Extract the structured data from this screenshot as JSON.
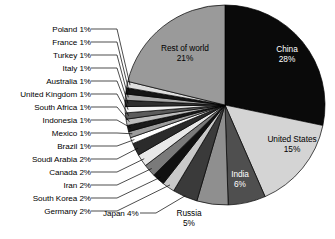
{
  "chart_data": {
    "type": "pie",
    "title": "",
    "subtitle": "",
    "xlabel": "",
    "ylabel": "",
    "legend_position": "none",
    "grid": false,
    "units": "percent",
    "total": 100,
    "categories": [
      "China",
      "United States",
      "India",
      "Russia",
      "Japan",
      "Germany",
      "South Korea",
      "Iran",
      "Canada",
      "Soudi Arabia",
      "Brazil",
      "Mexico",
      "Indonesia",
      "South Africa",
      "United Kingdom",
      "Australia",
      "Italy",
      "Turkey",
      "France",
      "Poland",
      "Rest of world"
    ],
    "values": [
      28,
      15,
      6,
      5,
      4,
      2,
      2,
      2,
      2,
      2,
      1,
      1,
      1,
      1,
      1,
      1,
      1,
      1,
      1,
      1,
      21
    ],
    "slices": [
      {
        "name": "China",
        "value": 28,
        "pct_text": "28%",
        "label": "China 28%",
        "color": "#0a0a0a",
        "label_placement": "inside",
        "label_color": "#ffffff"
      },
      {
        "name": "United States",
        "value": 15,
        "pct_text": "15%",
        "label": "United States 15%",
        "color": "#d4d4d4",
        "label_placement": "inside",
        "label_color": "#000000"
      },
      {
        "name": "India",
        "value": 6,
        "pct_text": "6%",
        "label": "India 6%",
        "color": "#4f4f4f",
        "label_placement": "inside",
        "label_color": "#ffffff"
      },
      {
        "name": "Russia",
        "value": 5,
        "pct_text": "5%",
        "label": "Russia 5%",
        "color": "#8f8f8f",
        "label_placement": "outside",
        "label_color": "#000000"
      },
      {
        "name": "Japan",
        "value": 4,
        "pct_text": "4%",
        "label": "Japan 4%",
        "color": "#3a3a3a",
        "label_placement": "callout",
        "label_color": "#000000"
      },
      {
        "name": "Germany",
        "value": 2,
        "pct_text": "2%",
        "label": "Germany 2%",
        "color": "#c9c9c9",
        "label_placement": "callout",
        "label_color": "#000000"
      },
      {
        "name": "South Korea",
        "value": 2,
        "pct_text": "2%",
        "label": "South Korea 2%",
        "color": "#111111",
        "label_placement": "callout",
        "label_color": "#000000"
      },
      {
        "name": "Iran",
        "value": 2,
        "pct_text": "2%",
        "label": "Iran 2%",
        "color": "#7a7a7a",
        "label_placement": "callout",
        "label_color": "#000000"
      },
      {
        "name": "Canada",
        "value": 2,
        "pct_text": "2%",
        "label": "Canada 2%",
        "color": "#e8e8e8",
        "label_placement": "callout",
        "label_color": "#000000"
      },
      {
        "name": "Soudi Arabia",
        "value": 2,
        "pct_text": "2%",
        "label": "Soudi Arabia 2%",
        "color": "#2b2b2b",
        "label_placement": "callout",
        "label_color": "#000000"
      },
      {
        "name": "Brazil",
        "value": 1,
        "pct_text": "1%",
        "label": "Brazil 1%",
        "color": "#ffffff",
        "label_placement": "callout",
        "label_color": "#000000"
      },
      {
        "name": "Mexico",
        "value": 1,
        "pct_text": "1%",
        "label": "Mexico 1%",
        "color": "#9c9c9c",
        "label_placement": "callout",
        "label_color": "#000000"
      },
      {
        "name": "Indonesia",
        "value": 1,
        "pct_text": "1%",
        "label": "Indonesia 1%",
        "color": "#1a1a1a",
        "label_placement": "callout",
        "label_color": "#000000"
      },
      {
        "name": "South Africa",
        "value": 1,
        "pct_text": "1%",
        "label": "South Africa 1%",
        "color": "#bdbdbd",
        "label_placement": "callout",
        "label_color": "#000000"
      },
      {
        "name": "United Kingdom",
        "value": 1,
        "pct_text": "1%",
        "label": "United Kingdom 1%",
        "color": "#5c5c5c",
        "label_placement": "callout",
        "label_color": "#000000"
      },
      {
        "name": "Australia",
        "value": 1,
        "pct_text": "1%",
        "label": "Australia 1%",
        "color": "#f2f2f2",
        "label_placement": "callout",
        "label_color": "#000000"
      },
      {
        "name": "Italy",
        "value": 1,
        "pct_text": "1%",
        "label": "Italy 1%",
        "color": "#2f2f2f",
        "label_placement": "callout",
        "label_color": "#000000"
      },
      {
        "name": "Turkey",
        "value": 1,
        "pct_text": "1%",
        "label": "Turkey 1%",
        "color": "#a8a8a8",
        "label_placement": "callout",
        "label_color": "#000000"
      },
      {
        "name": "France",
        "value": 1,
        "pct_text": "1%",
        "label": "France 1%",
        "color": "#141414",
        "label_placement": "callout",
        "label_color": "#000000"
      },
      {
        "name": "Poland",
        "value": 1,
        "pct_text": "1%",
        "label": "Poland 1%",
        "color": "#dedede",
        "label_placement": "callout",
        "label_color": "#000000"
      },
      {
        "name": "Rest of world",
        "value": 21,
        "pct_text": "21%",
        "label": "Rest of world 21%",
        "color": "#9a9a9a",
        "label_placement": "inside",
        "label_color": "#000000"
      }
    ]
  },
  "inner_labels": {
    "china": {
      "name": "China",
      "pct": "28%"
    },
    "united_states": {
      "name": "United States",
      "pct": "15%"
    },
    "india": {
      "name": "India",
      "pct": "6%"
    },
    "russia": {
      "name": "Russia",
      "pct": "5%"
    },
    "rest_of_world": {
      "name": "Rest of world",
      "pct": "21%"
    }
  },
  "callout_labels": {
    "poland": "Poland 1%",
    "france": "France 1%",
    "turkey": "Turkey 1%",
    "italy": "Italy 1%",
    "australia": "Australia 1%",
    "united_kingdom": "United Kingdom 1%",
    "south_africa": "South Africa 1%",
    "indonesia": "Indonesia 1%",
    "mexico": "Mexico 1%",
    "brazil": "Brazil 1%",
    "soudi_arabia": "Soudi Arabia 2%",
    "canada": "Canada 2%",
    "iran": "Iran 2%",
    "south_korea": "South Korea 2%",
    "germany": "Germany 2%",
    "japan": "Japan 4%"
  },
  "geometry": {
    "center_x": 225,
    "center_y": 105,
    "radius": 100,
    "start_angle_deg": 0,
    "direction": "clockwise"
  },
  "colors": {
    "background": "#ffffff",
    "stroke": "#000000",
    "text": "#000000",
    "text_on_dark": "#ffffff"
  }
}
